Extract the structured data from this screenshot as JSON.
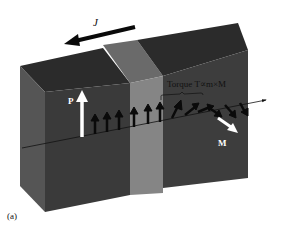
{
  "figure": {
    "panel_label": "(a)",
    "current_label": "J",
    "polarizer_label": "P",
    "magnetization_label": "M",
    "torque_label": "Torque T∝m×M"
  },
  "colors": {
    "background": "#ffffff",
    "top_face": "#2b2b2b",
    "front_face": "#3a3a3a",
    "side_face": "#555555",
    "spacer_front": "#858585",
    "spacer_top": "#6a6a6a",
    "arrow_dark": "#0a0a0a",
    "arrow_light": "#ffffff"
  },
  "layers": [
    {
      "name": "fixed-layer",
      "role": "polarizer",
      "position": "left"
    },
    {
      "name": "spacer",
      "role": "non-magnetic spacer",
      "position": "middle"
    },
    {
      "name": "free-layer",
      "role": "magnetization M",
      "position": "right"
    }
  ],
  "spin_arrows": {
    "aligned_count": 6,
    "rotating_count": 6
  }
}
